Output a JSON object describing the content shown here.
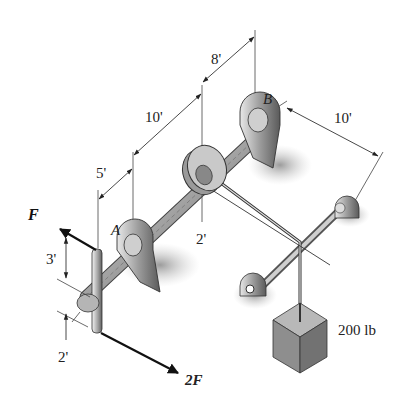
{
  "diagram": {
    "type": "isometric mechanics figure: shaft with pulley, crank handle and hanging weight",
    "labels": {
      "support_a": "A",
      "support_b": "B",
      "force_top": "F",
      "force_bottom": "2F",
      "weight": "200 lb"
    },
    "dimensions": {
      "end_to_a": "5'",
      "a_to_pulley": "10'",
      "pulley_to_b": "8'",
      "b_to_second_shaft": "10'",
      "pulley_radius": "2'",
      "crank_upper_arm": "3'",
      "crank_lower_arm": "2'"
    },
    "colors": {
      "shaft_light": "#d8d8d8",
      "shaft_dark": "#6a6a6a",
      "shadow": "#9a9a9a",
      "block_top": "#b5b5b5",
      "block_front": "#8c8c8c",
      "block_side": "#6f6f6f",
      "line": "#222222"
    }
  }
}
